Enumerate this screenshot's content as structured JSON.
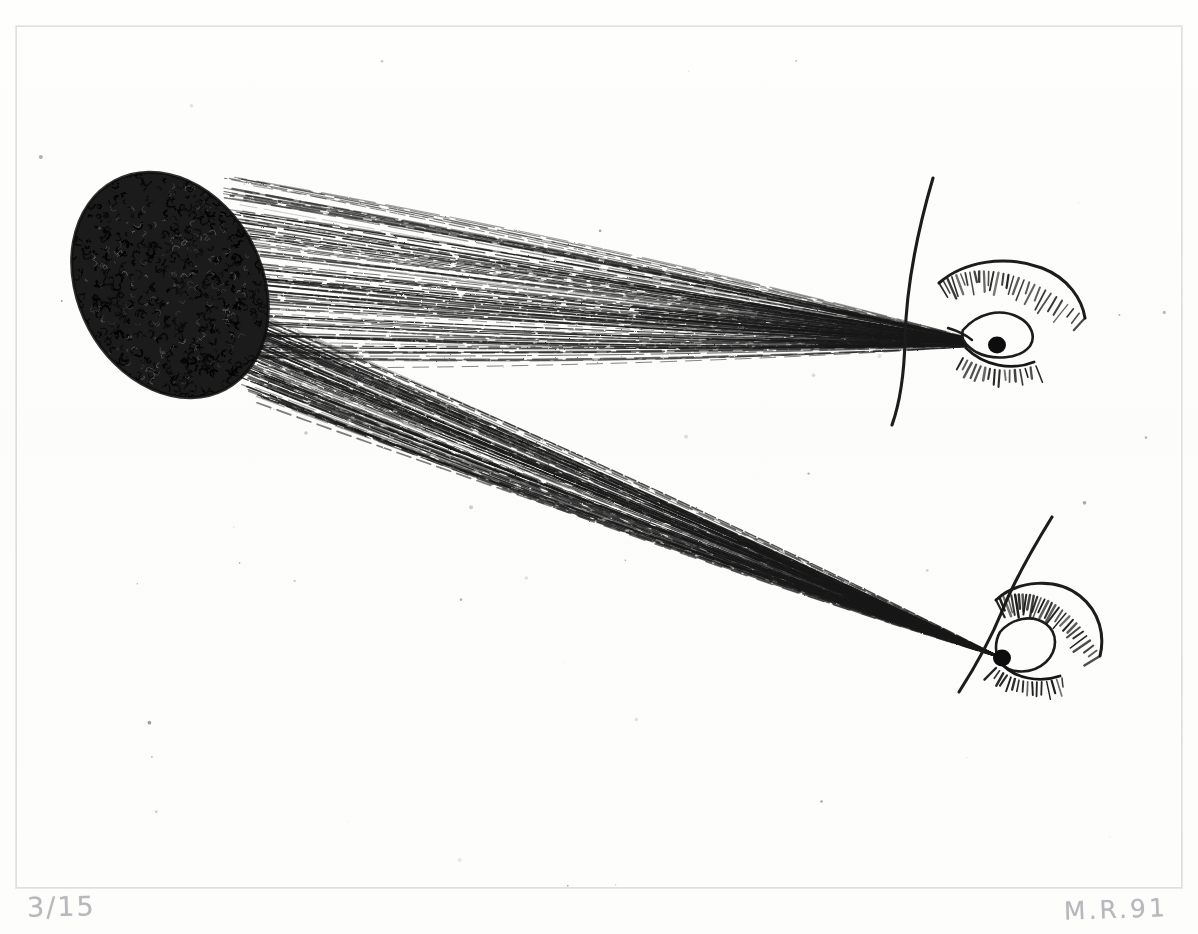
{
  "artwork": {
    "medium": "etching",
    "title": "Dark ovoid with converging ray bundles and two eyes",
    "support_color": "#fdfdfc",
    "ink_color": "#141414",
    "pencil_color": "#a9a9ae"
  },
  "inscriptions": {
    "edition_number": "3/15",
    "signature": "M.R.91"
  },
  "plate": {
    "left": 16,
    "top": 26,
    "width": 1164,
    "height": 860,
    "mark_label": "plate-mark"
  },
  "elements": {
    "ovoid": {
      "label": "dark-scribbled-ovoid",
      "cx": 170,
      "cy": 285,
      "rx": 92,
      "ry": 118,
      "rotation": -28
    },
    "upper_eye": {
      "label": "upper-right-eye",
      "pupil_x": 997,
      "pupil_y": 345,
      "brow_label": "eyebrow",
      "lash_label": "eyelashes",
      "hair_label": "long-curved-hair-line"
    },
    "lower_eye": {
      "label": "lower-right-eye",
      "pupil_x": 1002,
      "pupil_y": 658,
      "brow_label": "eyebrow",
      "lash_label": "eyelashes",
      "hair_label": "long-curved-hair-line"
    },
    "upper_ray_fan": {
      "label": "upper-ray-bundle",
      "origin_x": 997,
      "origin_y": 345,
      "spread_top_x": 232,
      "spread_top_y": 178,
      "spread_bottom_x": 250,
      "spread_bottom_y": 360,
      "line_count": 120
    },
    "lower_ray_fan": {
      "label": "lower-ray-bundle",
      "origin_x": 1002,
      "origin_y": 658,
      "spread_top_x": 212,
      "spread_top_y": 300,
      "spread_bottom_x": 262,
      "spread_bottom_y": 400,
      "line_count": 120
    }
  },
  "speckles": {
    "label": "foxing-specks",
    "count": 46
  }
}
